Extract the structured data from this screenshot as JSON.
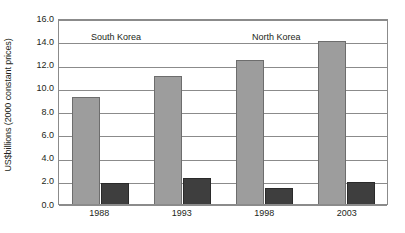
{
  "chart_data": {
    "type": "bar",
    "title": "",
    "subtitle": "",
    "xlabel": "",
    "ylabel": "US$billions (2000 constant prices)",
    "categories": [
      "1988",
      "1993",
      "1998",
      "2003"
    ],
    "series": [
      {
        "name": "South Korea",
        "color": "#9d9d9d",
        "values": [
          9.2,
          11.0,
          12.4,
          14.0
        ]
      },
      {
        "name": "North Korea",
        "color": "#3e3e3e",
        "values": [
          1.8,
          2.2,
          1.4,
          1.9
        ]
      }
    ],
    "ylim": [
      0.0,
      16.0
    ],
    "ytick_step": 2.0,
    "yticks": [
      "16.0",
      "14.0",
      "12.0",
      "10.0",
      "8.0",
      "6.0",
      "4.0",
      "2.0",
      "0.0"
    ],
    "ytick_values": [
      16.0,
      14.0,
      12.0,
      10.0,
      8.0,
      6.0,
      4.0,
      2.0,
      0.0
    ],
    "grid": true,
    "grid_color": "#8b8b8b",
    "legend_position": "inline-annotations",
    "annotations": [
      {
        "text": "South Korea",
        "series": "South Korea"
      },
      {
        "text": "North Korea",
        "series": "North Korea"
      }
    ],
    "plot_border_color": "#8b8b8b",
    "background_color": "#ffffff"
  }
}
